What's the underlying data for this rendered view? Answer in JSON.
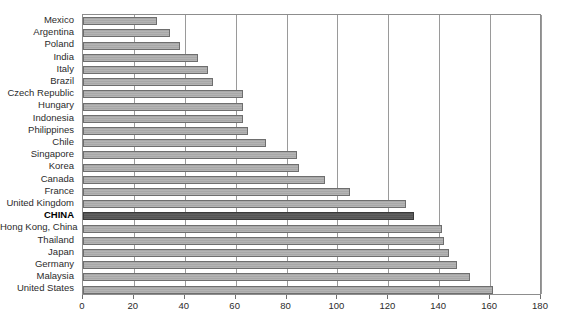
{
  "chart_data": {
    "type": "bar",
    "orientation": "horizontal",
    "title": "",
    "xlabel": "",
    "ylabel": "",
    "xlim": [
      0,
      180
    ],
    "xticks": [
      0,
      20,
      40,
      60,
      80,
      100,
      120,
      140,
      160,
      180
    ],
    "grid": true,
    "legend": "none",
    "highlight_category": "CHINA",
    "categories": [
      "Mexico",
      "Argentina",
      "Poland",
      "India",
      "Italy",
      "Brazil",
      "Czech Republic",
      "Hungary",
      "Indonesia",
      "Philippines",
      "Chile",
      "Singapore",
      "Korea",
      "Canada",
      "France",
      "United Kingdom",
      "CHINA",
      "Hong Kong, China",
      "Thailand",
      "Japan",
      "Germany",
      "Malaysia",
      "United States"
    ],
    "values": [
      29,
      34,
      38,
      45,
      49,
      51,
      63,
      63,
      63,
      65,
      72,
      84,
      85,
      95,
      105,
      127,
      130,
      141,
      142,
      144,
      147,
      152,
      161
    ]
  },
  "axis": {
    "tick_labels": [
      "0",
      "20",
      "40",
      "60",
      "80",
      "100",
      "120",
      "140",
      "160",
      "180"
    ]
  }
}
